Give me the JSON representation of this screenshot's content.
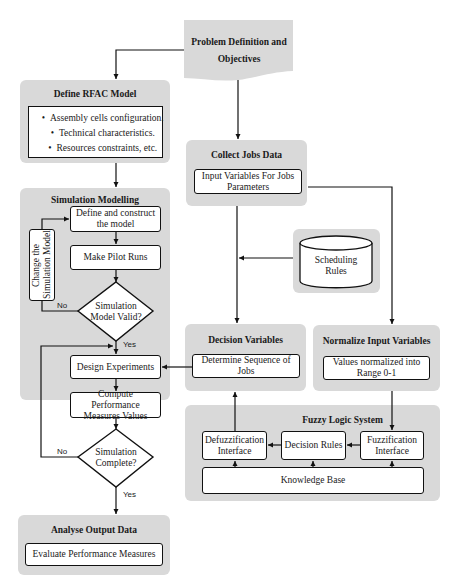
{
  "problem": {
    "label": "Problem Definition and Objectives"
  },
  "define_model": {
    "title": "Define RFAC Model",
    "items": [
      "Assembly cells configuration.",
      "Technical characteristics.",
      "Resources constraints, etc."
    ]
  },
  "simulation": {
    "title": "Simulation Modelling",
    "define_construct": "Define and construct the model",
    "pilot_runs": "Make Pilot Runs",
    "change_model": "Change the Simulation Model",
    "model_valid": "Simulation Model Valid?",
    "design_experiments": "Design Experiments",
    "compute_measures": "Compute Performance Measures Values",
    "complete": "Simulation Complete?",
    "yes_label": "Yes",
    "no_label": "No"
  },
  "analyse": {
    "title": "Analyse Output Data",
    "evaluate": "Evaluate Performance Measures"
  },
  "collect": {
    "title": "Collect Jobs Data",
    "input_vars": "Input Variables For Jobs Parameters"
  },
  "scheduling": {
    "label": "Scheduling Rules"
  },
  "decision_vars": {
    "title": "Decision Variables",
    "sequence": "Determine Sequence of Jobs"
  },
  "normalize": {
    "title": "Normalize Input Variables",
    "range": "Values normalized into Range 0-1"
  },
  "fuzzy": {
    "title": "Fuzzy Logic System",
    "defuzz": "Defuzzification Interface",
    "rules": "Decision Rules",
    "fuzz": "Fuzzification Interface",
    "knowledge": "Knowledge Base"
  },
  "colors": {
    "panel": "#d9d9d9",
    "box": "#ffffff",
    "line": "#111111"
  }
}
